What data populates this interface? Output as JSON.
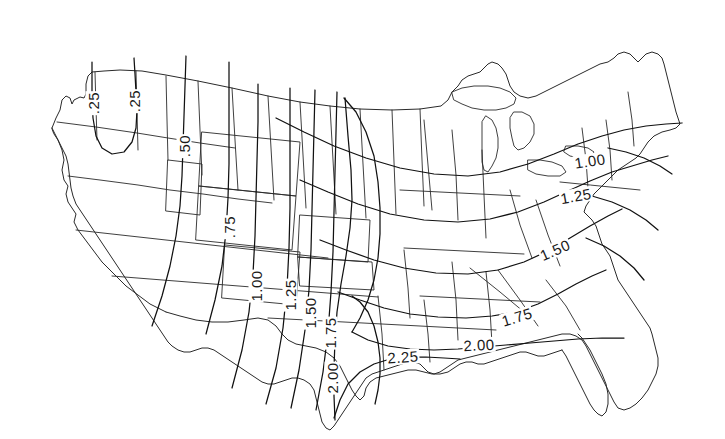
{
  "figure": {
    "kind": "contour-map",
    "region": "contiguous-united-states",
    "background_color": "#ffffff",
    "line_color": "#222222",
    "contour_color": "#111111",
    "border_line_width": 0.9,
    "contour_line_width": 1.2
  },
  "chart_data": {
    "type": "contour",
    "title": "",
    "subtitle": "",
    "xlabel": "",
    "ylabel": "",
    "grid": false,
    "legend": "none",
    "projection": "lambert-conformal-conic",
    "basemap": "us-state-outlines",
    "contour_interval": 0.25,
    "contour_levels": [
      0.25,
      0.5,
      0.75,
      1.0,
      1.25,
      1.5,
      1.75,
      2.0,
      2.25
    ],
    "value_range": [
      0.25,
      2.25
    ],
    "gradient_description": "values increase from northwest to southeast, maximum along the western Gulf coast",
    "labels": [
      {
        "id": "l-025-a",
        "text": ".25",
        "value": 0.25,
        "x": 93,
        "y": 103,
        "rotation": -90,
        "region": "washington"
      },
      {
        "id": "l-025-b",
        "text": ".25",
        "value": 0.25,
        "x": 134,
        "y": 101,
        "rotation": -90,
        "region": "idaho-panhandle"
      },
      {
        "id": "l-050",
        "text": ".50",
        "value": 0.5,
        "x": 184,
        "y": 146,
        "rotation": -90,
        "region": "montana-wyoming"
      },
      {
        "id": "l-075",
        "text": ".75",
        "value": 0.75,
        "x": 229,
        "y": 227,
        "rotation": -90,
        "region": "colorado-utah"
      },
      {
        "id": "l-100-w",
        "text": "1.00",
        "value": 1.0,
        "x": 256,
        "y": 286,
        "rotation": -90,
        "region": "new-mexico"
      },
      {
        "id": "l-125-w",
        "text": "1.25",
        "value": 1.25,
        "x": 290,
        "y": 295,
        "rotation": -90,
        "region": "texas-panhandle"
      },
      {
        "id": "l-150-w",
        "text": "1.50",
        "value": 1.5,
        "x": 310,
        "y": 313,
        "rotation": -90,
        "region": "north-texas"
      },
      {
        "id": "l-175-w",
        "text": "1.75",
        "value": 1.75,
        "x": 330,
        "y": 333,
        "rotation": -90,
        "region": "central-texas"
      },
      {
        "id": "l-200-w",
        "text": "2.00",
        "value": 2.0,
        "x": 332,
        "y": 378,
        "rotation": -90,
        "region": "south-texas"
      },
      {
        "id": "l-225",
        "text": "2.25",
        "value": 2.25,
        "x": 403,
        "y": 357,
        "rotation": -4,
        "region": "texas-gulf-coast"
      },
      {
        "id": "l-200-e",
        "text": "2.00",
        "value": 2.0,
        "x": 479,
        "y": 345,
        "rotation": -3,
        "region": "mississippi-alabama"
      },
      {
        "id": "l-175-e",
        "text": "1.75",
        "value": 1.75,
        "x": 517,
        "y": 317,
        "rotation": -17,
        "region": "georgia-south-carolina"
      },
      {
        "id": "l-150-e",
        "text": "1.50",
        "value": 1.5,
        "x": 555,
        "y": 250,
        "rotation": -24,
        "region": "virginia-north-carolina"
      },
      {
        "id": "l-125-e",
        "text": "1.25",
        "value": 1.25,
        "x": 576,
        "y": 196,
        "rotation": -10,
        "region": "pennsylvania-new-jersey"
      },
      {
        "id": "l-100-e",
        "text": "1.00",
        "value": 1.0,
        "x": 590,
        "y": 161,
        "rotation": -9,
        "region": "new-york-new-england"
      }
    ]
  }
}
